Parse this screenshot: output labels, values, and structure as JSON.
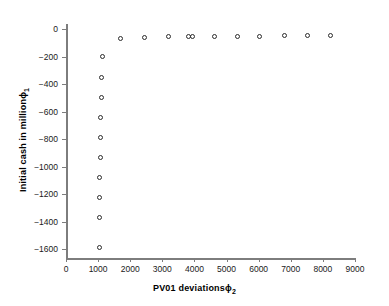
{
  "chart_data": {
    "type": "scatter",
    "title": "",
    "xlabel": "PV01 deviations ϕ₂",
    "ylabel": "Initial cash in million ϕ₁",
    "xlabel_base": "PV01 deviations",
    "xlabel_symbol": "ϕ",
    "xlabel_subscript": "2",
    "ylabel_base": "Initial cash in million",
    "ylabel_symbol": "ϕ",
    "ylabel_subscript": "1",
    "xlim": [
      0,
      9000
    ],
    "ylim": [
      -1650,
      30
    ],
    "xticks": [
      0,
      1000,
      2000,
      3000,
      4000,
      5000,
      6000,
      7000,
      8000,
      9000
    ],
    "xtick_labels": [
      "0",
      "1000",
      "2000",
      "3000",
      "4000",
      "5000",
      "6000",
      "7000",
      "8000",
      "9000"
    ],
    "yticks": [
      0,
      -200,
      -400,
      -600,
      -800,
      -1000,
      -1200,
      -1400,
      -1600
    ],
    "ytick_labels": [
      "0",
      "−200",
      "−400",
      "−600",
      "−800",
      "−1000",
      "−1200",
      "−1400",
      "−1600"
    ],
    "grid": false,
    "legend": null,
    "marker": "open-circle",
    "marker_color": "#2b2b2b",
    "axis_color": "#7d7d7d",
    "background": "#ffffff",
    "points": [
      {
        "x": 1030,
        "y": -1590
      },
      {
        "x": 1045,
        "y": -1370
      },
      {
        "x": 1050,
        "y": -1225
      },
      {
        "x": 1055,
        "y": -1080
      },
      {
        "x": 1060,
        "y": -935
      },
      {
        "x": 1070,
        "y": -790
      },
      {
        "x": 1080,
        "y": -640
      },
      {
        "x": 1090,
        "y": -495
      },
      {
        "x": 1110,
        "y": -350
      },
      {
        "x": 1150,
        "y": -200
      },
      {
        "x": 1700,
        "y": -72
      },
      {
        "x": 2460,
        "y": -60
      },
      {
        "x": 3185,
        "y": -58
      },
      {
        "x": 3810,
        "y": -58
      },
      {
        "x": 3950,
        "y": -58
      },
      {
        "x": 4640,
        "y": -56
      },
      {
        "x": 5350,
        "y": -52
      },
      {
        "x": 6040,
        "y": -52
      },
      {
        "x": 6815,
        "y": -50
      },
      {
        "x": 7530,
        "y": -48
      },
      {
        "x": 8250,
        "y": -46
      }
    ]
  }
}
